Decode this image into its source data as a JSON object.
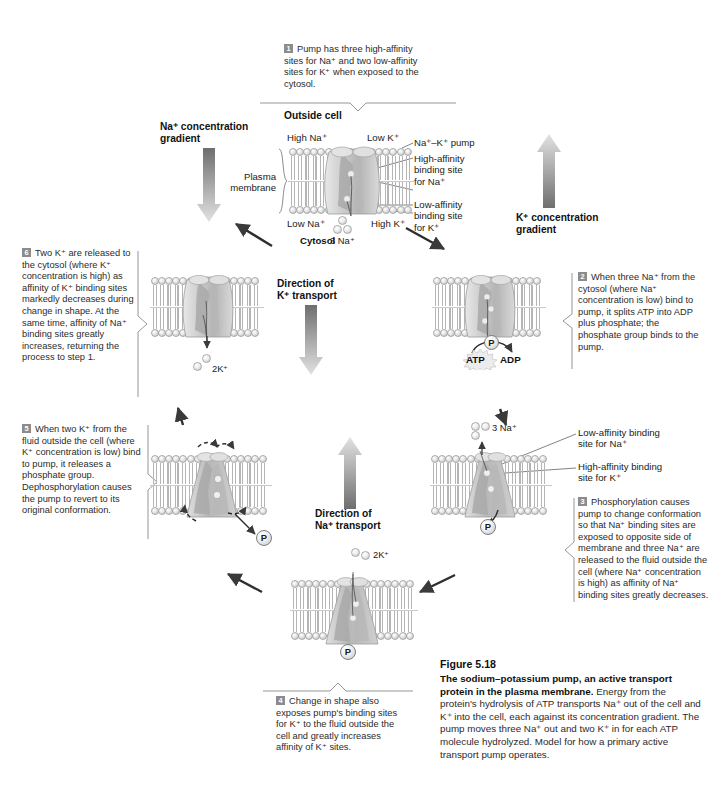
{
  "figure": {
    "number": "Figure 5.18",
    "title_bold": "The sodium–potassium pump, an active transport protein in the plasma membrane.",
    "body": " Energy from the protein's hydrolysis of ATP transports Na⁺ out of the cell and K⁺ into the cell, each against its concentration gradient. The pump moves three Na⁺ out and two K⁺ in for each ATP molecule hydrolyzed. Model for how a primary active transport pump operates."
  },
  "steps": [
    {
      "id": "step-1",
      "number": "1",
      "text": "Pump has three high-affinity sites for Na⁺ and two low-affinity sites for K⁺ when exposed to the cytosol."
    },
    {
      "id": "step-2",
      "number": "2",
      "text": "When three Na⁺ from the cytosol (where Na⁺ concentration is low) bind to pump, it splits ATP into ADP plus phosphate; the phosphate group binds to the pump."
    },
    {
      "id": "step-3",
      "number": "3",
      "text": "Phosphorylation causes pump to change conformation so that Na⁺ binding sites are exposed to opposite side of membrane and three Na⁺ are released to the fluid outside the cell (where Na⁺ concentration is high) as affinity of Na⁺ binding sites greatly decreases."
    },
    {
      "id": "step-4",
      "number": "4",
      "text": "Change in shape also exposes pump's binding sites for K⁺ to the fluid outside the cell and greatly increases affinity of K⁺ sites."
    },
    {
      "id": "step-5",
      "number": "5",
      "text": "When two K⁺ from the fluid outside the cell (where K⁺ concentration is low) bind to pump, it releases a phosphate group. Dephosphorylation causes the pump to revert to its original conformation."
    },
    {
      "id": "step-6",
      "number": "6",
      "text": "Two K⁺ are released to the cytosol (where K⁺ concentration is high) as affinity of K⁺ binding sites markedly decreases during change in shape. At the same time, affinity of Na⁺ binding sites greatly increases, returning the process to step 1."
    }
  ],
  "labels": {
    "outside_cell": "Outside cell",
    "cytosol": "Cytosol",
    "high_na": "High Na⁺",
    "low_k": "Low K⁺",
    "low_na": "Low Na⁺",
    "high_k": "High K⁺",
    "plasma_membrane": "Plasma\nmembrane",
    "plasma_membrane_l1": "Plasma",
    "plasma_membrane_l2": "membrane",
    "na_k_pump": "Na⁺–K⁺ pump",
    "high_affinity_na_l1": "High-affinity",
    "high_affinity_na_l2": "binding site",
    "high_affinity_na_l3": "for Na⁺",
    "low_affinity_k_l1": "Low-affinity",
    "low_affinity_k_l2": "binding site",
    "low_affinity_k_l3": "for K⁺",
    "na_gradient_l1": "Na⁺ concentration",
    "na_gradient_l2": "gradient",
    "k_gradient_l1": "K⁺ concentration",
    "k_gradient_l2": "gradient",
    "direction_k_l1": "Direction of",
    "direction_k_l2": "K⁺ transport",
    "direction_na_l1": "Direction of",
    "direction_na_l2": "Na⁺ transport",
    "low_affinity_na_l1": "Low-affinity binding",
    "low_affinity_na_l2": "site for Na⁺",
    "high_affinity_k_l1": "High-affinity binding",
    "high_affinity_k_l2": "site for K⁺",
    "three_na_top": "3 Na⁺",
    "three_na_right": "3 Na⁺",
    "two_k_left": "2K⁺",
    "two_k_bottom": "2K⁺",
    "atp": "ATP",
    "adp": "ADP",
    "phosphate": "P"
  },
  "colors": {
    "ink": "#231f20",
    "gray_text": "#2b2b2b",
    "step_badge": "#8c8c8c",
    "membrane_head": "#d8d8d8",
    "pump_fill": "#cfcfcf",
    "arrow_dark": "#6f6f6f",
    "arrow_light": "#dcdcdc"
  }
}
